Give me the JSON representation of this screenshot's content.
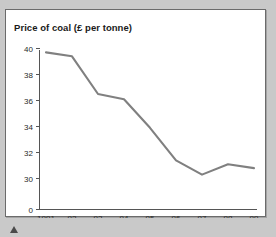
{
  "chart_data": {
    "type": "line",
    "title": "Price of coal (£ per tonne)",
    "xlabel": "",
    "ylabel": "",
    "x": [
      "1991",
      "92",
      "93",
      "94",
      "95",
      "96",
      "97",
      "98",
      "99"
    ],
    "categories": [
      "1991",
      "92",
      "93",
      "94",
      "95",
      "96",
      "97",
      "98",
      "99"
    ],
    "values": [
      39.7,
      39.4,
      36.5,
      36.1,
      33.9,
      31.4,
      30.3,
      31.1,
      30.8
    ],
    "series": [
      {
        "name": "Price of coal",
        "values": [
          39.7,
          39.4,
          36.5,
          36.1,
          33.9,
          31.4,
          30.3,
          31.1,
          30.8
        ]
      }
    ],
    "y_ticks": [
      40,
      38,
      36,
      34,
      32,
      30,
      0
    ],
    "y_tick_labels": [
      "40",
      "38",
      "36",
      "34",
      "32",
      "30",
      "0"
    ],
    "x_tick_labels": [
      "1991",
      "92",
      "93",
      "94",
      "95",
      "96",
      "97",
      "98",
      "99"
    ],
    "ylim": [
      30,
      40
    ],
    "axis_broken_at_zero": true,
    "grid": false,
    "legend": false,
    "legend_position": "none",
    "line_color": "#808080",
    "axis_color": "#555555",
    "text_color": "#1a1a1a",
    "panel_background": "#ffffff",
    "page_background": "#c9c9c9"
  },
  "figure": {
    "title": "Price of coal (£ per tonne)"
  },
  "marker": {
    "name": "triangle-marker"
  }
}
